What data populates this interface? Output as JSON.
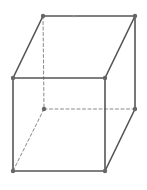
{
  "diagram": {
    "type": "cube-wireframe",
    "title": "",
    "colors": {
      "solid_edge": "#555555",
      "hidden_edge": "#888888",
      "vertex": "#666666",
      "background": "#ffffff"
    },
    "vertices": {
      "back_top_left": [
        43,
        16
      ],
      "back_top_right": [
        135,
        16
      ],
      "front_top_left": [
        13,
        78
      ],
      "front_top_right": [
        105,
        78
      ],
      "back_bottom_left": [
        44,
        109
      ],
      "back_bottom_right": [
        135,
        109
      ],
      "front_bottom_left": [
        13,
        171
      ],
      "front_bottom_right": [
        105,
        171
      ]
    },
    "solid_edges": [
      [
        "back_top_left",
        "back_top_right"
      ],
      [
        "back_top_left",
        "front_top_left"
      ],
      [
        "back_top_right",
        "front_top_right"
      ],
      [
        "front_top_left",
        "front_top_right"
      ],
      [
        "front_top_left",
        "front_bottom_left"
      ],
      [
        "front_top_right",
        "front_bottom_right"
      ],
      [
        "front_bottom_left",
        "front_bottom_right"
      ],
      [
        "back_top_right",
        "back_bottom_right"
      ],
      [
        "back_bottom_right",
        "front_bottom_right"
      ]
    ],
    "hidden_edges": [
      [
        "back_top_left",
        "back_bottom_left"
      ],
      [
        "back_bottom_left",
        "back_bottom_right"
      ],
      [
        "back_bottom_left",
        "front_bottom_left"
      ]
    ],
    "mark": {
      "text": "ı",
      "x": 73,
      "y": 14
    }
  }
}
